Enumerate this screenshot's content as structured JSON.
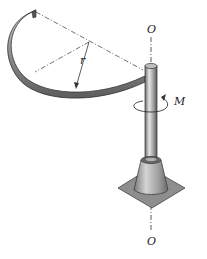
{
  "figure": {
    "labels": {
      "axis_top": "O",
      "axis_bottom": "O",
      "radius": "r",
      "moment": "M"
    },
    "colors": {
      "metal_dark": "#5a5a5a",
      "metal_mid": "#9a9a9a",
      "metal_light": "#d8d8d8",
      "base_plate": "#8c8c8c",
      "line": "#333333"
    }
  }
}
